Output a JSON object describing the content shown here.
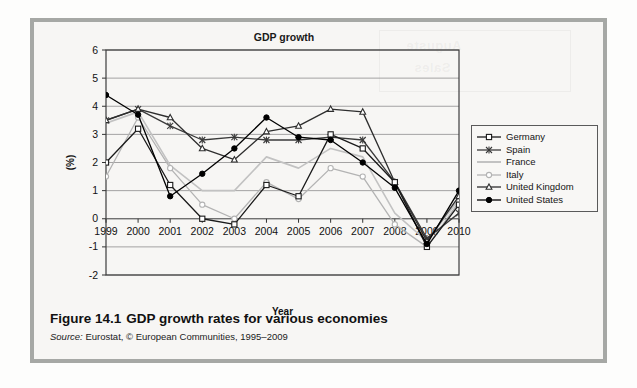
{
  "figure": {
    "caption_number": "Figure 14.1",
    "caption_text": "GDP growth rates for various economies",
    "source_prefix": "Source:",
    "source_text": " Eurostat, © European Communities, 1995–2009"
  },
  "chart_data": {
    "type": "line",
    "title": "GDP growth",
    "xlabel": "Year",
    "ylabel": "(%)",
    "grid": true,
    "legend_position": "right",
    "categories": [
      "1999",
      "2000",
      "2001",
      "2002",
      "2003",
      "2004",
      "2005",
      "2006",
      "2007",
      "2008",
      "2009",
      "2010"
    ],
    "x": [
      1999,
      2000,
      2001,
      2002,
      2003,
      2004,
      2005,
      2006,
      2007,
      2008,
      2009,
      2010
    ],
    "xlim": [
      1999,
      2010
    ],
    "ylim": [
      -2,
      6
    ],
    "yticks": [
      "6",
      "5",
      "4",
      "3",
      "2",
      "1",
      "0",
      "-1",
      "-2"
    ],
    "ytick_values": [
      6,
      5,
      4,
      3,
      2,
      1,
      0,
      -1,
      -2
    ],
    "series": [
      {
        "name": "Germany",
        "marker": "open-square",
        "color": "#1a1a1a",
        "values": [
          2.0,
          3.2,
          1.2,
          0.0,
          -0.2,
          1.2,
          0.8,
          3.0,
          2.5,
          1.3,
          -1.0,
          0.5
        ]
      },
      {
        "name": "Spain",
        "marker": "cross",
        "color": "#3a3a3a",
        "values": [
          3.5,
          3.9,
          3.3,
          2.8,
          2.9,
          2.8,
          2.8,
          2.9,
          2.8,
          1.3,
          -0.7,
          0.2
        ]
      },
      {
        "name": "France",
        "marker": "none",
        "color": "#c2c2c2",
        "values": [
          3.4,
          3.8,
          1.9,
          1.0,
          1.0,
          2.2,
          1.8,
          2.5,
          2.2,
          0.2,
          -0.8,
          0.7
        ]
      },
      {
        "name": "Italy",
        "marker": "open-circle",
        "color": "#b3b3b3",
        "values": [
          1.5,
          3.6,
          1.8,
          0.5,
          0.0,
          1.3,
          0.7,
          1.8,
          1.5,
          -0.2,
          -1.0,
          0.6
        ]
      },
      {
        "name": "United Kingdom",
        "marker": "open-triangle",
        "color": "#2e2e2e",
        "values": [
          3.5,
          3.9,
          3.6,
          2.5,
          2.1,
          3.1,
          3.3,
          3.9,
          3.8,
          1.3,
          -0.8,
          0.8
        ]
      },
      {
        "name": "United States",
        "marker": "filled-circle",
        "color": "#000000",
        "values": [
          4.4,
          3.7,
          0.8,
          1.6,
          2.5,
          3.6,
          2.9,
          2.8,
          2.0,
          1.1,
          -0.9,
          1.0
        ]
      }
    ]
  }
}
